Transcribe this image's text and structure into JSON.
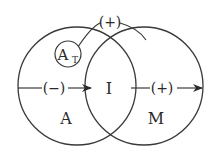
{
  "diagram": {
    "type": "venn",
    "colors": {
      "stroke": "#3a3a3a",
      "text": "#2a2a2a",
      "background": "#ffffff"
    },
    "sets": [
      {
        "id": "A",
        "label": "A"
      },
      {
        "id": "M",
        "label": "M"
      }
    ],
    "intersection": {
      "label": "I"
    },
    "subset": {
      "label_main": "A",
      "label_sub": "T"
    },
    "arrows": [
      {
        "from": "outside-left",
        "to": "I",
        "sign": "(−)"
      },
      {
        "from": "I",
        "to": "outside-right",
        "sign": "(+)"
      }
    ],
    "arc": {
      "from": "A_T",
      "to": "M",
      "sign": "(+)"
    }
  }
}
